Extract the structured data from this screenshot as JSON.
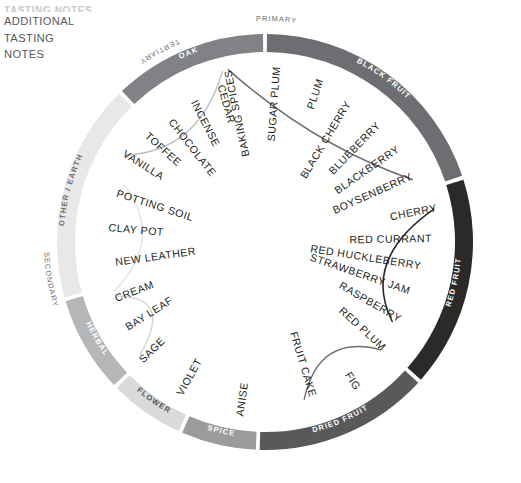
{
  "header": {
    "clipped_line": "TASTING NOTES",
    "title_lines": "ADDITIONAL\nTASTING\nNOTES",
    "line1": "ADDITIONAL",
    "line2": "TASTING",
    "line3": "NOTES"
  },
  "chart_data": {
    "type": "pie",
    "title": "Additional Tasting Notes",
    "legend": "none",
    "grid": false,
    "categories": [
      "BLACK FRUIT",
      "RED FRUIT",
      "DRIED FRUIT",
      "SPICE",
      "FLOWER",
      "HERBAL",
      "OTHER / EARTH",
      "OAK"
    ],
    "values": [
      72,
      60,
      50,
      22,
      22,
      28,
      62,
      64
    ],
    "colors": [
      "#6d6e71",
      "#2b2a29",
      "#58595b",
      "#9a9b9d",
      "#d9dadb",
      "#b5b6b8",
      "#e8e8e8",
      "#808285"
    ],
    "xlabel": "",
    "ylabel": ""
  },
  "outer_labels": [
    {
      "id": "primary",
      "text": "PRIMARY"
    },
    {
      "id": "tertiary",
      "text": "TERTIARY"
    },
    {
      "id": "secondary",
      "text": "SECONDARY"
    }
  ],
  "bands": [
    {
      "id": "black-fruit",
      "label": "BLACK FRUIT",
      "color": "#6d6e71",
      "label_color": "#ffffff",
      "era": "PRIMARY",
      "terms": [
        "SUGAR PLUM",
        "PLUM",
        "BLACK CHERRY",
        "BLUEBERRY",
        "BLACKBERRY",
        "BOYSENBERRY"
      ]
    },
    {
      "id": "red-fruit",
      "label": "RED FRUIT",
      "color": "#2b2a29",
      "label_color": "#ffffff",
      "era": "PRIMARY",
      "terms": [
        "CHERRY",
        "RED CURRANT",
        "RED HUCKLEBERRY",
        "STRAWBERRY JAM",
        "RASPBERRY"
      ]
    },
    {
      "id": "dried-fruit",
      "label": "DRIED FRUIT",
      "color": "#58595b",
      "label_color": "#ffffff",
      "era": "PRIMARY",
      "terms": [
        "RED PLUM",
        "FIG",
        "FRUIT CAKE"
      ]
    },
    {
      "id": "spice",
      "label": "SPICE",
      "color": "#9a9b9d",
      "label_color": "#ffffff",
      "era": "PRIMARY",
      "terms": [
        "ANISE"
      ]
    },
    {
      "id": "flower",
      "label": "FLOWER",
      "color": "#d9dadb",
      "label_color": "#58595b",
      "era": "PRIMARY",
      "terms": [
        "VIOLET"
      ]
    },
    {
      "id": "herbal",
      "label": "HERBAL",
      "color": "#b5b6b8",
      "label_color": "#ffffff",
      "era": "PRIMARY",
      "terms": [
        "SAGE",
        "BAY LEAF"
      ]
    },
    {
      "id": "other-earth",
      "label": "OTHER / EARTH",
      "color": "#e8e8e8",
      "label_color": "#6d6e71",
      "era": "SECONDARY",
      "terms": [
        "CREAM",
        "NEW LEATHER",
        "CLAY POT",
        "POTTING SOIL"
      ]
    },
    {
      "id": "oak",
      "label": "OAK",
      "color": "#808285",
      "label_color": "#ffffff",
      "era": "TERTIARY",
      "terms": [
        "VANILLA",
        "TOFFEE",
        "CHOCOLATE",
        "INCENSE",
        "CEDAR",
        "BAKING SPICES"
      ]
    }
  ],
  "terms_flat": [
    "BAKING SPICES",
    "SUGAR PLUM",
    "PLUM",
    "BLACK CHERRY",
    "BLUEBERRY",
    "BLACKBERRY",
    "BOYSENBERRY",
    "CHERRY",
    "RED CURRANT",
    "RED HUCKLEBERRY",
    "STRAWBERRY JAM",
    "RASPBERRY",
    "RED PLUM",
    "FIG",
    "FRUIT CAKE",
    "ANISE",
    "VIOLET",
    "SAGE",
    "BAY LEAF",
    "CREAM",
    "NEW LEATHER",
    "CLAY POT",
    "POTTING SOIL",
    "TOFFEE",
    "CHOCOLATE",
    "INCENSE",
    "CEDAR",
    "VANILLA"
  ],
  "colors": {
    "ink": "#231f20",
    "muted": "#6d6e71",
    "page_bg": "#ffffff"
  }
}
